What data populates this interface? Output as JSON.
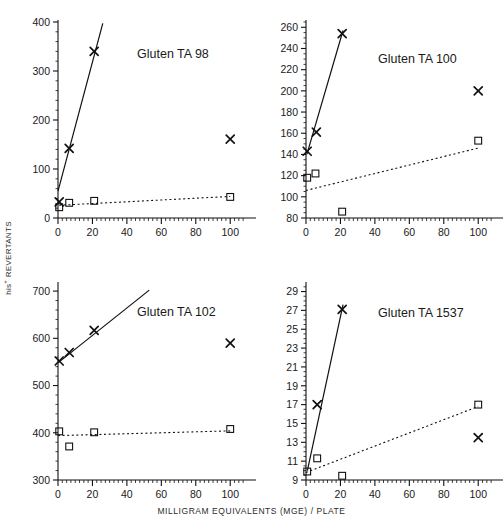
{
  "figure": {
    "xlabel": "MILLIGRAM EQUIVALENTS (MGE) / PLATE",
    "ylabel_main": "REVERTANTS",
    "ylabel_prefix": "his",
    "ylabel_sup": "+"
  },
  "chart_data": [
    {
      "type": "scatter",
      "title": "Gluten TA 98",
      "panel": "top-left",
      "xlabel": "MILLIGRAM EQUIVALENTS (MGE) / PLATE",
      "ylabel": "his+ REVERTANTS",
      "xlim": [
        0,
        108
      ],
      "ylim": [
        0,
        400
      ],
      "yticks": [
        0,
        100,
        200,
        300,
        400
      ],
      "xticks": [
        0,
        20,
        40,
        60,
        80,
        100
      ],
      "xminor_step": 2.5,
      "yminor_step": 20,
      "grid": false,
      "legend": "none",
      "series": [
        {
          "name": "with S9 activation",
          "marker": "x",
          "line": "solid",
          "x": [
            0.7,
            6.5,
            21,
            100
          ],
          "y": [
            33,
            142,
            340,
            161
          ],
          "fit_line": {
            "x": [
              0.0,
              26.0
            ],
            "y": [
              55,
              397
            ],
            "excluded_points": [
              3
            ]
          }
        },
        {
          "name": "without S9 activation",
          "marker": "square",
          "line": "dotted",
          "x": [
            0.7,
            6.5,
            21,
            100
          ],
          "y": [
            22,
            31,
            35,
            43
          ],
          "fit_line": {
            "x": [
              0.7,
              100
            ],
            "y": [
              26,
              44
            ],
            "excluded_points": []
          }
        }
      ]
    },
    {
      "type": "scatter",
      "title": "Gluten TA 100",
      "panel": "top-right",
      "xlabel": "MILLIGRAM EQUIVALENTS (MGE) / PLATE",
      "ylabel": "his+ REVERTANTS",
      "xlim": [
        0,
        108
      ],
      "ylim": [
        80,
        265
      ],
      "yticks": [
        80,
        100,
        120,
        140,
        160,
        180,
        200,
        220,
        240,
        260
      ],
      "xticks": [
        0,
        20,
        40,
        60,
        80,
        100
      ],
      "xminor_step": 2.5,
      "yminor_step": 5,
      "grid": false,
      "legend": "none",
      "series": [
        {
          "name": "with S9 activation",
          "marker": "x",
          "line": "solid",
          "x": [
            0.7,
            6.0,
            21,
            100
          ],
          "y": [
            143,
            161,
            254,
            200
          ],
          "fit_line": {
            "x": [
              0.5,
              21.5
            ],
            "y": [
              140,
              257
            ],
            "excluded_points": [
              3
            ]
          }
        },
        {
          "name": "without S9 activation",
          "marker": "square",
          "line": "dotted",
          "x": [
            0.7,
            5.5,
            21,
            100
          ],
          "y": [
            118,
            122,
            86,
            153
          ],
          "fit_line": {
            "x": [
              0.0,
              100
            ],
            "y": [
              106,
              146
            ],
            "excluded_points": []
          }
        }
      ]
    },
    {
      "type": "scatter",
      "title": "Gluten TA 102",
      "panel": "bottom-left",
      "xlabel": "MILLIGRAM EQUIVALENTS (MGE) / PLATE",
      "ylabel": "his+ REVERTANTS",
      "xlim": [
        0,
        108
      ],
      "ylim": [
        300,
        715
      ],
      "yticks": [
        300,
        400,
        500,
        600,
        700
      ],
      "xticks": [
        0,
        20,
        40,
        60,
        80,
        100
      ],
      "xminor_step": 2.5,
      "yminor_step": 20,
      "grid": false,
      "legend": "none",
      "series": [
        {
          "name": "with S9 activation",
          "marker": "x",
          "line": "solid",
          "x": [
            0.7,
            6.5,
            21,
            100
          ],
          "y": [
            552,
            570,
            617,
            590
          ],
          "fit_line": {
            "x": [
              0.0,
              53.0
            ],
            "y": [
              548,
              702
            ],
            "excluded_points": [
              3
            ]
          }
        },
        {
          "name": "without S9 activation",
          "marker": "square",
          "line": "dotted",
          "x": [
            0.7,
            6.5,
            21,
            100
          ],
          "y": [
            403,
            371,
            401,
            408
          ],
          "fit_line": {
            "x": [
              0.0,
              100
            ],
            "y": [
              394,
              404
            ],
            "excluded_points": []
          }
        }
      ]
    },
    {
      "type": "scatter",
      "title": "Gluten TA 1537",
      "panel": "bottom-right",
      "xlabel": "MILLIGRAM EQUIVALENTS (MGE) / PLATE",
      "ylabel": "his+ REVERTANTS",
      "xlim": [
        0,
        108
      ],
      "ylim": [
        9,
        29.8
      ],
      "yticks": [
        9,
        11,
        13,
        15,
        17,
        19,
        21,
        23,
        25,
        27,
        29
      ],
      "xticks": [
        0,
        20,
        40,
        60,
        80,
        100
      ],
      "xminor_step": 2.5,
      "yminor_step": 0.5,
      "grid": false,
      "legend": "none",
      "series": [
        {
          "name": "with S9 activation",
          "marker": "x",
          "line": "solid",
          "x": [
            6.5,
            21,
            100
          ],
          "y": [
            17.0,
            27.1,
            13.5
          ],
          "fit_line": {
            "x": [
              0.8,
              21.5
            ],
            "y": [
              10.0,
              27.6
            ],
            "excluded_points": [
              2
            ]
          }
        },
        {
          "name": "without S9 activation",
          "marker": "square",
          "line": "dotted",
          "x": [
            0.7,
            6.5,
            21,
            100
          ],
          "y": [
            9.9,
            11.3,
            9.45,
            17.0
          ],
          "fit_line": {
            "x": [
              0.0,
              100
            ],
            "y": [
              9.8,
              16.8
            ],
            "excluded_points": []
          }
        }
      ]
    }
  ],
  "panels": [
    {
      "title": "Gluten TA 98"
    },
    {
      "title": "Gluten TA 100"
    },
    {
      "title": "Gluten TA 102"
    },
    {
      "title": "Gluten TA 1537"
    }
  ]
}
